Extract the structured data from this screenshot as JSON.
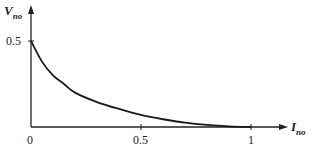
{
  "chart_data": {
    "type": "line",
    "title": "",
    "xlabel": "I_no",
    "ylabel": "V_no",
    "xlabel_main": "I",
    "xlabel_sub": "no",
    "ylabel_main": "V",
    "ylabel_sub": "no",
    "xlim": [
      0,
      1.15
    ],
    "ylim": [
      0,
      0.55
    ],
    "grid": false,
    "x_ticks": [
      "0",
      "0.5",
      "1"
    ],
    "y_ticks": [
      "0.5"
    ],
    "series": [
      {
        "name": "V_no vs I_no",
        "x": [
          0,
          0.05,
          0.1,
          0.15,
          0.2,
          0.3,
          0.4,
          0.5,
          0.6,
          0.7,
          0.8,
          0.9,
          1.0
        ],
        "y": [
          0.5,
          0.38,
          0.3,
          0.25,
          0.2,
          0.145,
          0.105,
          0.07,
          0.045,
          0.025,
          0.012,
          0.004,
          0
        ]
      }
    ],
    "color": "#1a1a1a"
  }
}
